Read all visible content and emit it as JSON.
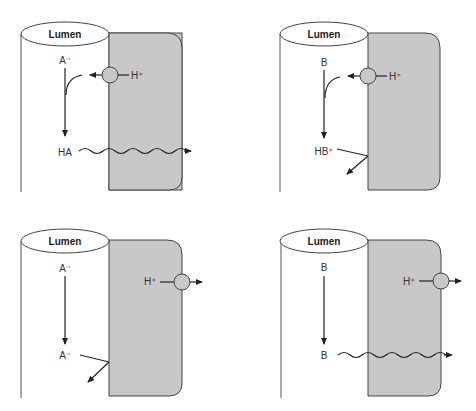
{
  "colors": {
    "cell": "#c8c8c8",
    "stroke": "#3a3a3a",
    "line": "#222222",
    "transporter": "#c8c8c8"
  },
  "panels": [
    {
      "position": "top-left",
      "lumen_label": "Lumen",
      "species_top": "A⁻",
      "species_bottom": "HA",
      "proton_label": "H⁺",
      "transporter_side": "apical",
      "bottom_fate": "diffuses through cell (wavy arrow)"
    },
    {
      "position": "top-right",
      "lumen_label": "Lumen",
      "species_top": "B",
      "species_bottom": "HB⁺",
      "proton_label": "H⁺",
      "transporter_side": "apical",
      "bottom_fate": "reflected back into lumen"
    },
    {
      "position": "bottom-left",
      "lumen_label": "Lumen",
      "species_top": "A⁻",
      "species_bottom": "A⁻",
      "proton_label": "H⁺",
      "transporter_side": "basolateral",
      "bottom_fate": "reflected back into lumen"
    },
    {
      "position": "bottom-right",
      "lumen_label": "Lumen",
      "species_top": "B",
      "species_bottom": "B",
      "proton_label": "H⁺",
      "transporter_side": "basolateral",
      "bottom_fate": "diffuses through cell (wavy arrow)"
    }
  ]
}
